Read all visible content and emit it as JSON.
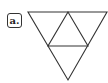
{
  "label": "a.",
  "figure": {
    "shape": "inverted-triangle-subdivided",
    "subtriangles": 4,
    "stroke_color": "#333333"
  }
}
